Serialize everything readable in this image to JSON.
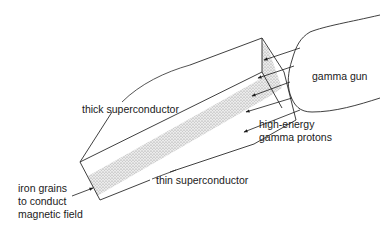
{
  "diagram": {
    "labels": {
      "gamma_gun": "gamma gun",
      "thick_superconductor": "thick superconductor",
      "high_energy_line1": "high-energy",
      "high_energy_line2": "gamma protons",
      "thin_superconductor": "thin superconductor",
      "iron_line1": "iron grains",
      "iron_line2": "to conduct",
      "iron_line3": "magnetic field"
    },
    "colors": {
      "line": "#2a2a2a",
      "stipple": "#bdbdbd",
      "background": "#ffffff"
    }
  }
}
